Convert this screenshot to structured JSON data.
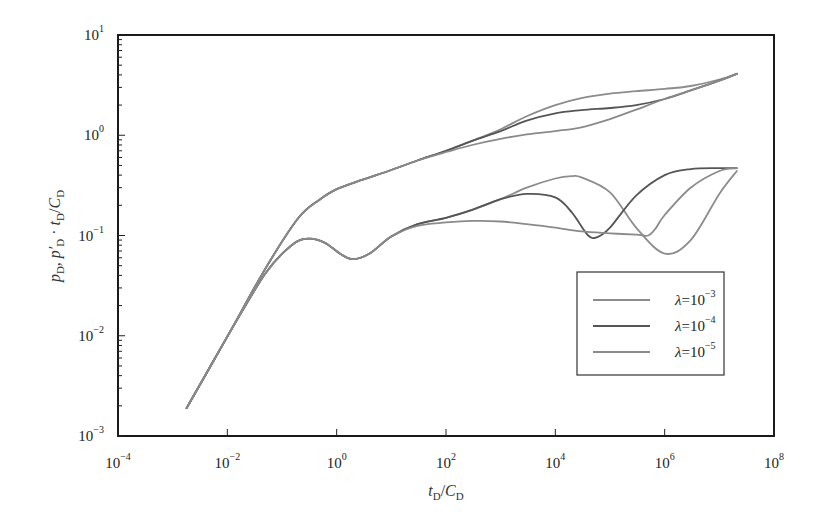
{
  "chart_data": {
    "type": "line",
    "title": "",
    "xscale": "log",
    "yscale": "log",
    "xlim": [
      0.0001,
      100000000
    ],
    "ylim": [
      0.001,
      10
    ],
    "xlabel": "t_D/C_D",
    "ylabel": "p_D, p'_D · t_D/C_D",
    "x_ticks": [
      {
        "base": "10",
        "exp": "-4",
        "value": -4
      },
      {
        "base": "10",
        "exp": "-2",
        "value": -2
      },
      {
        "base": "10",
        "exp": "0",
        "value": 0
      },
      {
        "base": "10",
        "exp": "2",
        "value": 2
      },
      {
        "base": "10",
        "exp": "4",
        "value": 4
      },
      {
        "base": "10",
        "exp": "6",
        "value": 6
      },
      {
        "base": "10",
        "exp": "8",
        "value": 8
      }
    ],
    "y_ticks": [
      {
        "base": "10",
        "exp": "-3",
        "value": -3
      },
      {
        "base": "10",
        "exp": "-2",
        "value": -2
      },
      {
        "base": "10",
        "exp": "-1",
        "value": -1
      },
      {
        "base": "10",
        "exp": "0",
        "value": 0
      },
      {
        "base": "10",
        "exp": "1",
        "value": 1
      }
    ],
    "grid": false,
    "legend_position": "lower right (inside)",
    "series": [
      {
        "name": "λ=10^-3",
        "label_base": "λ=10",
        "label_exp": "-3",
        "color": "#8c8c8c",
        "width": 1.8,
        "pressure": {
          "x": [
            0.0018,
            0.01,
            0.05,
            0.2,
            0.5,
            1,
            3,
            10,
            30,
            100,
            300,
            1000,
            3000,
            10000,
            30000,
            100000,
            300000,
            1000000,
            3000000,
            10000000,
            21000000
          ],
          "y": [
            0.0019,
            0.0098,
            0.047,
            0.15,
            0.23,
            0.29,
            0.36,
            0.45,
            0.56,
            0.7,
            0.88,
            1.15,
            1.55,
            2.0,
            2.35,
            2.6,
            2.75,
            2.9,
            3.1,
            3.6,
            4.1
          ]
        },
        "derivative": {
          "x": [
            0.0018,
            0.01,
            0.05,
            0.15,
            0.3,
            0.6,
            1.2,
            2,
            4,
            10,
            30,
            100,
            300,
            1000,
            3000,
            10000,
            20000,
            30000,
            100000,
            300000,
            1000000,
            3000000,
            10000000,
            21000000
          ],
          "y": [
            0.0019,
            0.0098,
            0.042,
            0.08,
            0.093,
            0.085,
            0.065,
            0.058,
            0.066,
            0.098,
            0.13,
            0.15,
            0.18,
            0.23,
            0.3,
            0.37,
            0.39,
            0.38,
            0.27,
            0.12,
            0.066,
            0.09,
            0.26,
            0.44,
            0.47
          ]
        }
      },
      {
        "name": "λ=10^-4",
        "label_base": "λ=10",
        "label_exp": "-4",
        "color": "#555555",
        "width": 1.8,
        "pressure": {
          "x": [
            0.0018,
            0.01,
            0.05,
            0.2,
            0.5,
            1,
            3,
            10,
            30,
            100,
            300,
            1000,
            3000,
            10000,
            30000,
            100000,
            300000,
            1000000,
            3000000,
            10000000,
            21000000
          ],
          "y": [
            0.0019,
            0.0098,
            0.047,
            0.15,
            0.23,
            0.29,
            0.36,
            0.45,
            0.56,
            0.7,
            0.88,
            1.1,
            1.4,
            1.65,
            1.78,
            1.87,
            2.0,
            2.3,
            2.8,
            3.5,
            4.1
          ]
        },
        "derivative": {
          "x": [
            0.0018,
            0.01,
            0.05,
            0.15,
            0.3,
            0.6,
            1.2,
            2,
            4,
            10,
            30,
            100,
            300,
            1000,
            3000,
            10000,
            20000,
            40000,
            60000,
            100000,
            300000,
            1000000,
            3000000,
            10000000,
            21000000
          ],
          "y": [
            0.0019,
            0.0098,
            0.042,
            0.08,
            0.093,
            0.085,
            0.065,
            0.058,
            0.066,
            0.098,
            0.13,
            0.15,
            0.18,
            0.23,
            0.26,
            0.24,
            0.17,
            0.1,
            0.097,
            0.12,
            0.25,
            0.4,
            0.46,
            0.47,
            0.47
          ]
        }
      },
      {
        "name": "λ=10^-5",
        "label_base": "λ=10",
        "label_exp": "-5",
        "color": "#8a8a8a",
        "width": 1.8,
        "pressure": {
          "x": [
            0.0018,
            0.01,
            0.05,
            0.2,
            0.5,
            1,
            3,
            10,
            30,
            100,
            300,
            1000,
            3000,
            10000,
            30000,
            100000,
            300000,
            1000000,
            3000000,
            10000000,
            21000000
          ],
          "y": [
            0.0019,
            0.0098,
            0.047,
            0.15,
            0.23,
            0.29,
            0.36,
            0.45,
            0.56,
            0.68,
            0.8,
            0.92,
            1.02,
            1.1,
            1.2,
            1.45,
            1.8,
            2.3,
            2.8,
            3.5,
            4.1
          ]
        },
        "derivative": {
          "x": [
            0.0018,
            0.01,
            0.05,
            0.15,
            0.3,
            0.6,
            1.2,
            2,
            4,
            10,
            30,
            100,
            300,
            1000,
            3000,
            10000,
            30000,
            100000,
            300000,
            500000,
            700000,
            1000000,
            3000000,
            10000000,
            21000000
          ],
          "y": [
            0.0019,
            0.0098,
            0.042,
            0.08,
            0.093,
            0.085,
            0.065,
            0.058,
            0.066,
            0.098,
            0.125,
            0.135,
            0.14,
            0.138,
            0.13,
            0.12,
            0.11,
            0.105,
            0.102,
            0.1,
            0.12,
            0.16,
            0.3,
            0.44,
            0.47
          ]
        }
      }
    ]
  },
  "plot_area": {
    "left": 118,
    "top": 35,
    "right": 774,
    "bottom": 436
  },
  "legend": {
    "left": 577,
    "top": 272,
    "width": 147,
    "height": 103
  },
  "frame_color": "#1a1a1a"
}
